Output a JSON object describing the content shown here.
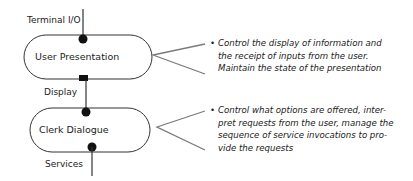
{
  "diagram": {
    "components": [
      {
        "name": "User Presentation"
      },
      {
        "name": "Clerk Dialogue"
      }
    ],
    "connectors": {
      "top": "Terminal I/O",
      "middle": "Display",
      "bottom": "Services"
    },
    "descriptions": [
      {
        "bullet": "•",
        "lines": [
          "Control the display of information and",
          "the receipt of inputs from the user.",
          "Maintain the state of the presentation"
        ]
      },
      {
        "bullet": "•",
        "lines": [
          "Control what options are offered, inter-",
          "pret requests from the user, manage the",
          "sequence of service invocations to pro-",
          "vide the requests"
        ]
      }
    ],
    "colors": {
      "stroke": "#333333",
      "callout": "#7a7a7a",
      "text": "#222222"
    }
  }
}
